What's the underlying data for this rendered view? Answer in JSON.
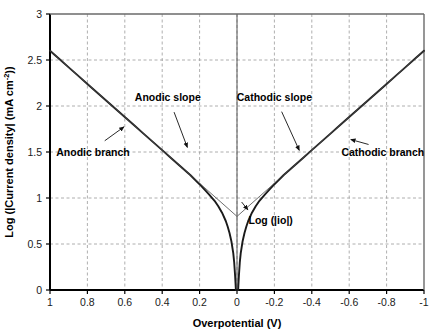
{
  "chart_data": {
    "type": "line",
    "title": "",
    "xlabel": "Overpotential (V)",
    "ylabel": "Log (|Current density| (mA cm",
    "ylabel_sup": "-2",
    "ylabel_tail": "))",
    "xlim": [
      1,
      -1
    ],
    "ylim": [
      0,
      3
    ],
    "xticks": [
      "1",
      "0.8",
      "0.6",
      "0.4",
      "0.2",
      "0",
      "-0.2",
      "-0.4",
      "-0.6",
      "-0.8",
      "-1"
    ],
    "xtick_values": [
      1,
      0.8,
      0.6,
      0.4,
      0.2,
      0,
      -0.2,
      -0.4,
      -0.6,
      -0.8,
      -1
    ],
    "yticks": [
      "0",
      "0.5",
      "1",
      "1.5",
      "2",
      "2.5",
      "3"
    ],
    "ytick_values": [
      0,
      0.5,
      1,
      1.5,
      2,
      2.5,
      3
    ],
    "grid": true,
    "grid_style": "dashed",
    "legend": "none",
    "log_i0": 0.8,
    "series": [
      {
        "name": "Anodic branch",
        "comment": "Butterfly curve, positive overpotential side; log|i| = log(i0) + log(10^(eta/ba) - 10^(-eta/bc))",
        "x": [
          1.0,
          0.95,
          0.9,
          0.85,
          0.8,
          0.75,
          0.7,
          0.65,
          0.6,
          0.55,
          0.5,
          0.45,
          0.4,
          0.35,
          0.3,
          0.25,
          0.2,
          0.15,
          0.12,
          0.1,
          0.08,
          0.06,
          0.05,
          0.04,
          0.03,
          0.02,
          0.015,
          0.01,
          0.006,
          0.003,
          0.001
        ],
        "y": [
          2.6,
          2.51,
          2.42,
          2.33,
          2.24,
          2.15,
          2.06,
          1.97,
          1.88,
          1.79,
          1.7,
          1.61,
          1.52,
          1.43,
          1.34,
          1.25,
          1.15,
          1.04,
          0.97,
          0.91,
          0.84,
          0.75,
          0.69,
          0.62,
          0.53,
          0.4,
          0.3,
          0.15,
          -0.1,
          -0.4,
          -0.9
        ]
      },
      {
        "name": "Cathodic branch",
        "comment": "Butterfly curve, negative overpotential side",
        "x": [
          -1.0,
          -0.95,
          -0.9,
          -0.85,
          -0.8,
          -0.75,
          -0.7,
          -0.65,
          -0.6,
          -0.55,
          -0.5,
          -0.45,
          -0.4,
          -0.35,
          -0.3,
          -0.25,
          -0.2,
          -0.15,
          -0.12,
          -0.1,
          -0.08,
          -0.06,
          -0.05,
          -0.04,
          -0.03,
          -0.02,
          -0.015,
          -0.01,
          -0.006,
          -0.003,
          -0.001
        ],
        "y": [
          2.6,
          2.51,
          2.42,
          2.33,
          2.24,
          2.15,
          2.06,
          1.97,
          1.88,
          1.79,
          1.7,
          1.61,
          1.52,
          1.43,
          1.34,
          1.25,
          1.15,
          1.04,
          0.97,
          0.91,
          0.84,
          0.75,
          0.69,
          0.62,
          0.53,
          0.4,
          0.3,
          0.15,
          -0.1,
          -0.4,
          -0.9
        ]
      },
      {
        "name": "Anodic slope",
        "comment": "Tafel extrapolation line, thin",
        "x": [
          1.0,
          0.0
        ],
        "y": [
          2.6,
          0.8
        ]
      },
      {
        "name": "Cathodic slope",
        "comment": "Tafel extrapolation line, thin",
        "x": [
          -1.0,
          0.0
        ],
        "y": [
          2.6,
          0.8
        ]
      }
    ],
    "annotations": [
      {
        "id": "anodic-branch",
        "text": "Anodic branch",
        "label_x": 0.77,
        "label_y": 1.46,
        "arrow_to_x": 0.585,
        "arrow_to_y": 1.81
      },
      {
        "id": "anodic-slope",
        "text": "Anodic slope",
        "label_x": 0.37,
        "label_y": 2.05,
        "arrow_to_x": 0.255,
        "arrow_to_y": 1.5
      },
      {
        "id": "cathodic-slope",
        "text": "Cathodic slope",
        "label_x": -0.2,
        "label_y": 2.05,
        "arrow_to_x": -0.345,
        "arrow_to_y": 1.47
      },
      {
        "id": "cathodic-branch",
        "text": "Cathodic branch",
        "label_x": -0.78,
        "label_y": 1.46,
        "arrow_to_x": -0.585,
        "arrow_to_y": 1.66
      },
      {
        "id": "log-i0",
        "text": "Log (|io|)",
        "label_x": -0.18,
        "label_y": 0.72,
        "arrow_to_x": -0.035,
        "arrow_to_y": 0.9
      }
    ]
  },
  "colors": {
    "curve": "#1a1a1a",
    "slope_line": "#4a4a4a",
    "axis": "#000000",
    "grid": "#9a9a9a",
    "background": "#ffffff",
    "text": "#000000"
  }
}
